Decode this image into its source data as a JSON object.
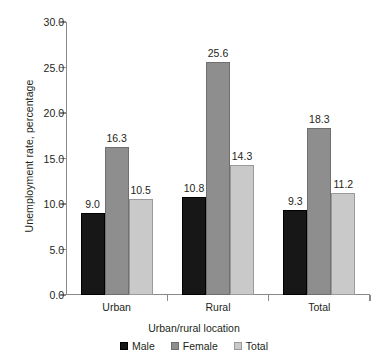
{
  "chart_data": {
    "type": "bar",
    "title": "",
    "subtitle": "",
    "xlabel": "Urban/rural location",
    "ylabel": "Unemployment rate, percentage",
    "categories": [
      "Urban",
      "Rural",
      "Total"
    ],
    "series": [
      {
        "name": "Male",
        "color": "#171717",
        "values": [
          9.0,
          10.8,
          9.3
        ]
      },
      {
        "name": "Female",
        "color": "#8e8e8e",
        "values": [
          16.3,
          25.6,
          18.3
        ]
      },
      {
        "name": "Total",
        "color": "#c9c9c9",
        "values": [
          14.3,
          14.3,
          11.2
        ]
      }
    ],
    "series_values_display": {
      "Urban": [
        "9.0",
        "16.3",
        "10.5"
      ],
      "Rural": [
        "10.8",
        "25.6",
        "14.3"
      ],
      "Total": [
        "9.3",
        "18.3",
        "11.2"
      ]
    },
    "ylim": [
      0.0,
      30.0
    ],
    "ytick_labels": [
      "0.0",
      "5.0",
      "10.0",
      "15.0",
      "20.0",
      "25.0",
      "30.0"
    ],
    "ytick_values": [
      0.0,
      5.0,
      10.0,
      15.0,
      20.0,
      25.0,
      30.0
    ],
    "grid": false,
    "legend_position": "bottom",
    "legend": [
      "Male",
      "Female",
      "Total"
    ],
    "data_labels_shown": true
  },
  "axes": {
    "y_title": "Unemployment rate, percentage",
    "x_title": "Urban/rural location"
  },
  "legend": {
    "items": [
      {
        "label": "Male"
      },
      {
        "label": "Female"
      },
      {
        "label": "Total"
      }
    ]
  },
  "ticks": {
    "y": [
      {
        "label": "30.0",
        "value": 30.0
      },
      {
        "label": "25.0",
        "value": 25.0
      },
      {
        "label": "20.0",
        "value": 20.0
      },
      {
        "label": "15.0",
        "value": 15.0
      },
      {
        "label": "10.0",
        "value": 10.0
      },
      {
        "label": "5.0",
        "value": 5.0
      },
      {
        "label": "0.0",
        "value": 0.0
      }
    ]
  },
  "groups": [
    {
      "name": "Urban",
      "bars": [
        {
          "series": "Male",
          "value": 9.0,
          "label": "9.0"
        },
        {
          "series": "Female",
          "value": 16.3,
          "label": "16.3"
        },
        {
          "series": "Total",
          "value": 10.5,
          "label": "10.5"
        }
      ]
    },
    {
      "name": "Rural",
      "bars": [
        {
          "series": "Male",
          "value": 10.8,
          "label": "10.8"
        },
        {
          "series": "Female",
          "value": 25.6,
          "label": "25.6"
        },
        {
          "series": "Total",
          "value": 14.3,
          "label": "14.3"
        }
      ]
    },
    {
      "name": "Total",
      "bars": [
        {
          "series": "Male",
          "value": 9.3,
          "label": "9.3"
        },
        {
          "series": "Female",
          "value": 18.3,
          "label": "18.3"
        },
        {
          "series": "Total",
          "value": 11.2,
          "label": "11.2"
        }
      ]
    }
  ]
}
